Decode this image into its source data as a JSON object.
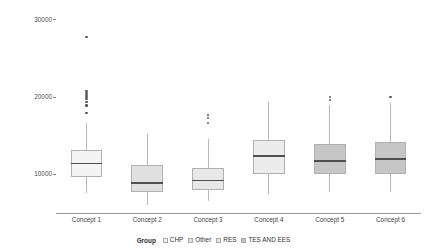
{
  "chart_data": {
    "type": "box",
    "title": "",
    "xlabel": "",
    "ylabel": "Opex / Nominal IT Power [€/kW]",
    "ylim": [
      5000,
      31500
    ],
    "yticks": [
      10000,
      20000,
      30000
    ],
    "ytick_labels": [
      "10000",
      "20000",
      "30000"
    ],
    "grid": false,
    "categories": [
      "Concept 1",
      "Concept 2",
      "Concept 3",
      "Concept 4",
      "Concept 5",
      "Concept 6"
    ],
    "legend": {
      "title": "Group",
      "position": "bottom",
      "entries": [
        {
          "label": "CHP",
          "color": "#f2f2f2"
        },
        {
          "label": "Other",
          "color": "#e2e2e2"
        },
        {
          "label": "RES",
          "color": "#eaeaea"
        },
        {
          "label": "TES AND EES",
          "color": "#c6c6c6"
        }
      ]
    },
    "boxes": [
      {
        "category": "Concept 1",
        "group": "CHP",
        "color": "#f4f4f4",
        "whisker_low": 7600,
        "q1": 9700,
        "median": 11400,
        "q3": 13200,
        "whisker_high": 16600,
        "outliers": [
          17900,
          18900,
          19300,
          19700,
          20000,
          20300,
          20500,
          20800,
          27700
        ]
      },
      {
        "category": "Concept 2",
        "group": "Other",
        "color": "#e0e0e0",
        "whisker_low": 6000,
        "q1": 7700,
        "median": 8900,
        "q3": 11200,
        "whisker_high": 15200,
        "outliers": []
      },
      {
        "category": "Concept 3",
        "group": "RES",
        "color": "#e8e8e8",
        "whisker_low": 6500,
        "q1": 8000,
        "median": 9200,
        "q3": 10800,
        "whisker_high": 14600,
        "outliers": [
          16600,
          17300,
          17700
        ]
      },
      {
        "category": "Concept 4",
        "group": "RES",
        "color": "#ececec",
        "whisker_low": 7500,
        "q1": 10100,
        "median": 12400,
        "q3": 14500,
        "whisker_high": 19400,
        "outliers": []
      },
      {
        "category": "Concept 5",
        "group": "TES AND EES",
        "color": "#c6c6c6",
        "whisker_low": 7700,
        "q1": 10000,
        "median": 11700,
        "q3": 13900,
        "whisker_high": 18900,
        "outliers": [
          19600,
          20000
        ]
      },
      {
        "category": "Concept 6",
        "group": "TES AND EES",
        "color": "#c6c6c6",
        "whisker_low": 7700,
        "q1": 10100,
        "median": 12000,
        "q3": 14200,
        "whisker_high": 19200,
        "outliers": [
          20000
        ]
      }
    ]
  }
}
